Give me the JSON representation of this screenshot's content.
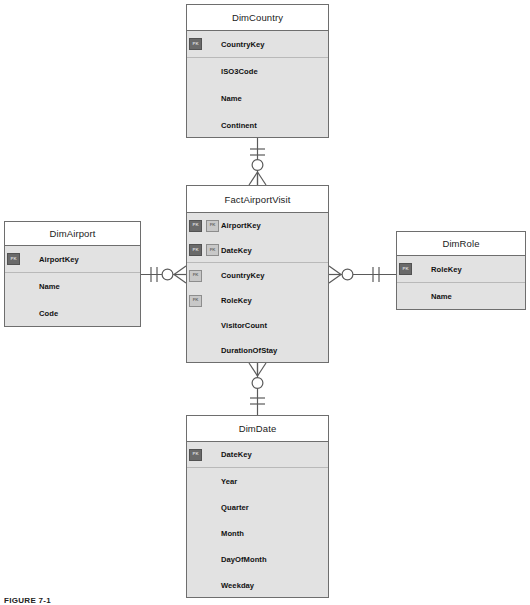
{
  "figure": {
    "caption": "FIGURE 7-1"
  },
  "notation": {
    "primary_key_badge": "PK",
    "foreign_key_badge": "FK",
    "style": "crow's foot",
    "one_and_only_one": "||",
    "zero_or_many": "o<"
  },
  "colors": {
    "entity_border": "#6e6e6e",
    "entity_header_bg": "#ffffff",
    "entity_body_bg": "#e2e2e2",
    "row_divider": "#b9b9b9",
    "pk_badge_bg": "#6a6a6a",
    "fk_badge_bg": "#c8c8c8",
    "connector_line": "#5a5a5a",
    "text": "#111111"
  },
  "entities": [
    {
      "id": "dim-country",
      "name": "DimCountry",
      "x": 186,
      "y": 4,
      "width": 143,
      "height": 134,
      "header_height": 26,
      "row_height": 27,
      "fields": [
        {
          "name": "CountryKey",
          "badges": [
            "PK"
          ],
          "divider_below": true
        },
        {
          "name": "ISO3Code",
          "badges": [],
          "divider_below": false
        },
        {
          "name": "Name",
          "badges": [],
          "divider_below": false
        },
        {
          "name": "Continent",
          "badges": [],
          "divider_below": false
        }
      ]
    },
    {
      "id": "fact-airport-visit",
      "name": "FactAirportVisit",
      "x": 186,
      "y": 185,
      "width": 143,
      "height": 178,
      "header_height": 27,
      "row_height": 25,
      "fields": [
        {
          "name": "AirportKey",
          "badges": [
            "PK",
            "FK"
          ],
          "divider_below": false
        },
        {
          "name": "DateKey",
          "badges": [
            "PK",
            "FK"
          ],
          "divider_below": true
        },
        {
          "name": "CountryKey",
          "badges": [
            "FK"
          ],
          "divider_below": false
        },
        {
          "name": "RoleKey",
          "badges": [
            "FK"
          ],
          "divider_below": false
        },
        {
          "name": "VisitorCount",
          "badges": [],
          "divider_below": false
        },
        {
          "name": "DurationOfStay",
          "badges": [],
          "divider_below": false
        }
      ]
    },
    {
      "id": "dim-airport",
      "name": "DimAirport",
      "x": 4,
      "y": 221,
      "width": 137,
      "height": 106,
      "header_height": 24,
      "row_height": 27,
      "fields": [
        {
          "name": "AirportKey",
          "badges": [
            "PK"
          ],
          "divider_below": true
        },
        {
          "name": "Name",
          "badges": [],
          "divider_below": false
        },
        {
          "name": "Code",
          "badges": [],
          "divider_below": false
        }
      ]
    },
    {
      "id": "dim-role",
      "name": "DimRole",
      "x": 396,
      "y": 231,
      "width": 130,
      "height": 79,
      "header_height": 24,
      "row_height": 27,
      "fields": [
        {
          "name": "RoleKey",
          "badges": [
            "PK"
          ],
          "divider_below": true
        },
        {
          "name": "Name",
          "badges": [],
          "divider_below": false
        }
      ]
    },
    {
      "id": "dim-date",
      "name": "DimDate",
      "x": 186,
      "y": 415,
      "width": 143,
      "height": 183,
      "header_height": 26,
      "row_height": 26,
      "fields": [
        {
          "name": "DateKey",
          "badges": [
            "PK"
          ],
          "divider_below": true
        },
        {
          "name": "Year",
          "badges": [],
          "divider_below": false
        },
        {
          "name": "Quarter",
          "badges": [],
          "divider_below": false
        },
        {
          "name": "Month",
          "badges": [],
          "divider_below": false
        },
        {
          "name": "DayOfMonth",
          "badges": [],
          "divider_below": false
        },
        {
          "name": "Weekday",
          "badges": [],
          "divider_below": false
        }
      ]
    }
  ],
  "relationships": [
    {
      "id": "country-to-fact",
      "from": "DimCountry",
      "to": "FactAirportVisit",
      "from_cardinality": "one and only one",
      "to_cardinality": "zero or many",
      "orientation": "vertical"
    },
    {
      "id": "airport-to-fact",
      "from": "DimAirport",
      "to": "FactAirportVisit",
      "from_cardinality": "one and only one",
      "to_cardinality": "zero or many",
      "orientation": "horizontal"
    },
    {
      "id": "role-to-fact",
      "from": "DimRole",
      "to": "FactAirportVisit",
      "from_cardinality": "one and only one",
      "to_cardinality": "zero or many",
      "orientation": "horizontal"
    },
    {
      "id": "date-to-fact",
      "from": "DimDate",
      "to": "FactAirportVisit",
      "from_cardinality": "one and only one",
      "to_cardinality": "zero or many",
      "orientation": "vertical"
    }
  ]
}
